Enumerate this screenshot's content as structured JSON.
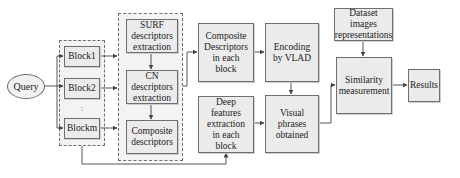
{
  "diagram": {
    "query": "Query",
    "blocks": [
      "Block1",
      "Block2",
      "Blockm"
    ],
    "ellipsis": ":",
    "descriptor_steps": {
      "surf": "SURF descriptors extraction",
      "cn": "CN descriptors extraction",
      "composite": "Composite descriptors"
    },
    "composite_each_block": "Composite Descriptors in each block",
    "deep_features": "Deep features extraction in each block",
    "encoding": "Encoding by VLAD",
    "visual_phrases": "Visual phrases obtained",
    "dataset": "Dataset images representations",
    "similarity": "Similarity measurement",
    "results": "Results"
  },
  "colors": {
    "box_fill": "#ebebeb",
    "group_fill": "#f3f3f3",
    "border": "#6e6e6e",
    "line": "#555555"
  }
}
